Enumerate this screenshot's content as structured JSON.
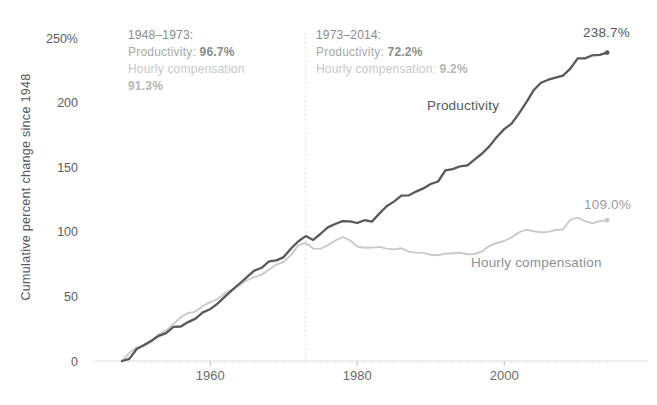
{
  "figure": {
    "y_axis_title": "Cumulative percent change since 1948",
    "annotations": [
      {
        "title": "1948–1973:",
        "productivity_label": "Productivity:",
        "productivity_value": "96.7%",
        "compensation_label": "Hourly compensation",
        "compensation_value": "91.3%"
      },
      {
        "title": "1973–2014:",
        "productivity_label": "Productivity:",
        "productivity_value": "72.2%",
        "compensation_label": "Hourly compensation:",
        "compensation_value": "9.2%"
      }
    ],
    "series_labels": {
      "productivity": "Productivity",
      "compensation": "Hourly compensation"
    },
    "end_labels": {
      "productivity": "238.7%",
      "compensation": "109.0%"
    }
  },
  "chart_data": {
    "type": "line",
    "title": "",
    "xlabel": "",
    "ylabel": "Cumulative percent change since 1948",
    "xlim": [
      1948,
      2014
    ],
    "ylim": [
      0,
      250
    ],
    "grid": false,
    "legend_position": "inline-labels",
    "reference_line_x": 1973,
    "x_ticks": [
      {
        "value": 1960,
        "label": "1960"
      },
      {
        "value": 1980,
        "label": "1980"
      },
      {
        "value": 2000,
        "label": "2000"
      }
    ],
    "y_ticks": [
      {
        "value": 250,
        "label": "250%"
      },
      {
        "value": 200,
        "label": "200"
      },
      {
        "value": 150,
        "label": "150"
      },
      {
        "value": 100,
        "label": "100"
      },
      {
        "value": 50,
        "label": "50"
      },
      {
        "value": 0,
        "label": "0"
      }
    ],
    "colors": {
      "productivity": "#58595b",
      "compensation": "#c9cacb",
      "axis": "#dcdcdc",
      "major_tick": "#c2c2c2",
      "minor_tick": "#e6e6e6",
      "reference_line": "#d2d2d2",
      "x_tick_label": "#6a6b6d",
      "y_tick_label": "#5c5d5f"
    },
    "x": [
      1948,
      1949,
      1950,
      1951,
      1952,
      1953,
      1954,
      1955,
      1956,
      1957,
      1958,
      1959,
      1960,
      1961,
      1962,
      1963,
      1964,
      1965,
      1966,
      1967,
      1968,
      1969,
      1970,
      1971,
      1972,
      1973,
      1974,
      1975,
      1976,
      1977,
      1978,
      1979,
      1980,
      1981,
      1982,
      1983,
      1984,
      1985,
      1986,
      1987,
      1988,
      1989,
      1990,
      1991,
      1992,
      1993,
      1994,
      1995,
      1996,
      1997,
      1998,
      1999,
      2000,
      2001,
      2002,
      2003,
      2004,
      2005,
      2006,
      2007,
      2008,
      2009,
      2010,
      2011,
      2012,
      2013,
      2014
    ],
    "series": [
      {
        "name": "Hourly compensation",
        "end_value": 109.0,
        "values": [
          0.0,
          6.3,
          10.5,
          11.8,
          15.0,
          20.8,
          23.5,
          28.7,
          33.9,
          37.1,
          38.2,
          42.6,
          45.5,
          48.0,
          52.5,
          55.0,
          58.5,
          62.5,
          64.9,
          66.9,
          70.7,
          74.7,
          76.6,
          82.0,
          89.7,
          91.3,
          87.0,
          86.8,
          89.7,
          93.1,
          96.0,
          93.4,
          88.6,
          87.6,
          87.8,
          88.3,
          87.0,
          86.4,
          87.3,
          84.6,
          83.9,
          83.7,
          82.2,
          81.9,
          83.0,
          83.4,
          83.8,
          82.7,
          82.8,
          84.8,
          89.2,
          91.3,
          92.9,
          95.6,
          99.5,
          101.6,
          100.5,
          99.7,
          99.9,
          101.4,
          101.8,
          109.3,
          111.0,
          108.3,
          106.5,
          108.3,
          109.0
        ]
      },
      {
        "name": "Productivity",
        "end_value": 238.7,
        "values": [
          0.0,
          1.6,
          9.3,
          12.3,
          15.6,
          19.5,
          21.6,
          26.5,
          26.7,
          30.1,
          32.8,
          37.6,
          40.1,
          44.4,
          49.8,
          55.0,
          60.0,
          64.9,
          70.0,
          72.1,
          77.2,
          77.9,
          80.4,
          87.1,
          92.7,
          96.7,
          93.7,
          98.3,
          103.4,
          106.0,
          108.3,
          108.1,
          106.8,
          109.0,
          107.9,
          114.1,
          119.7,
          123.4,
          128.0,
          128.2,
          131.1,
          133.6,
          137.0,
          138.9,
          147.5,
          148.5,
          150.7,
          151.4,
          156.1,
          160.6,
          166.3,
          173.4,
          179.5,
          183.7,
          191.5,
          200.2,
          209.5,
          215.4,
          217.7,
          219.3,
          220.9,
          226.2,
          234.3,
          234.2,
          236.6,
          236.9,
          238.7
        ]
      }
    ]
  }
}
